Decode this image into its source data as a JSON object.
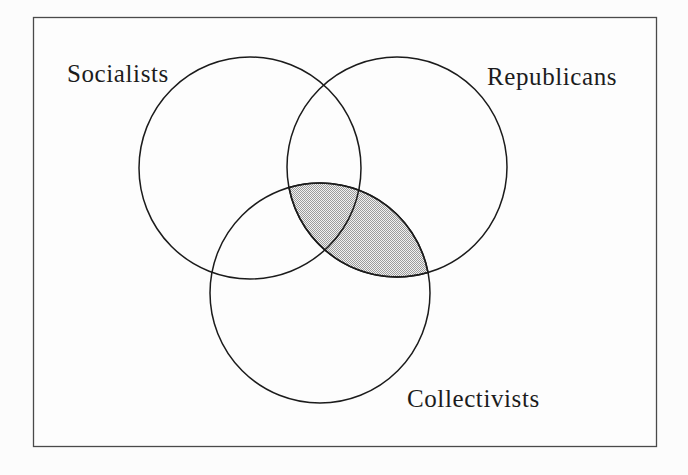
{
  "figure": {
    "kind": "venn-diagram",
    "sets": [
      {
        "id": "socialists",
        "label": "Socialists"
      },
      {
        "id": "republicans",
        "label": "Republicans"
      },
      {
        "id": "collectivists",
        "label": "Collectivists"
      }
    ],
    "shaded_region": {
      "sets": [
        "Republicans",
        "Collectivists"
      ],
      "description": "Intersection of Republicans and Collectivists is shaded (includes triple overlap with Socialists)"
    },
    "colors": {
      "stroke": "#1b1b1b",
      "border": "#4a4a4a",
      "shade_dot": "#9b9b9b",
      "shade_base": "#f1f1f1",
      "background": "#fdfdfd"
    }
  }
}
